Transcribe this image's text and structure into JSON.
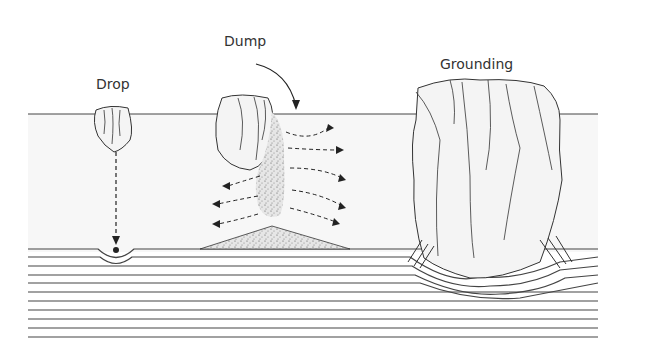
{
  "diagram": {
    "labels": {
      "drop": "Drop",
      "dump": "Dump",
      "grounding": "Grounding"
    },
    "colors": {
      "line": "#333333",
      "water": "#f7f7f7",
      "ice": "#f4f4f4"
    }
  }
}
